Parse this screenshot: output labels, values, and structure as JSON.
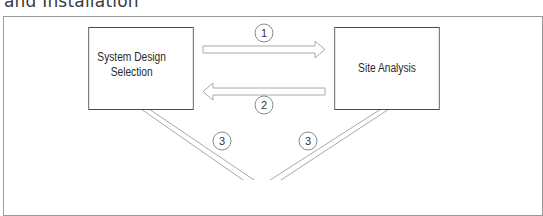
{
  "caption": "and Installation",
  "diagram": {
    "nodes": [
      {
        "id": "system-design-selection",
        "label_line1": "System Design",
        "label_line2": "Selection"
      },
      {
        "id": "site-analysis",
        "label": "Site Analysis"
      }
    ],
    "edges": [
      {
        "from": "system-design-selection",
        "to": "site-analysis",
        "step": "1"
      },
      {
        "from": "site-analysis",
        "to": "system-design-selection",
        "step": "2"
      },
      {
        "from": "system-design-selection",
        "to": "below",
        "step": "3"
      },
      {
        "from": "site-analysis",
        "to": "below",
        "step": "3"
      }
    ]
  },
  "labels": {
    "step1": "1",
    "step2": "2",
    "step3a": "3",
    "step3b": "3"
  },
  "colors": {
    "box_border": "#4a4a4a",
    "arrow_outline": "#a8a8a8",
    "frame": "#9a9a9a"
  }
}
